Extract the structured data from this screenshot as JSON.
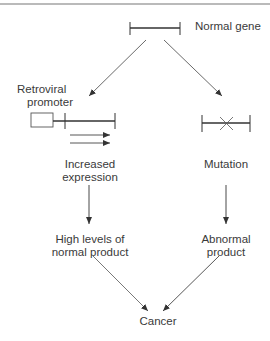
{
  "diagram": {
    "type": "flowchart",
    "nodes": {
      "normal_gene": {
        "label": "Normal gene"
      },
      "retroviral_promoter": {
        "line1": "Retroviral",
        "line2": "promoter"
      },
      "increased_expression": {
        "line1": "Increased",
        "line2": "expression"
      },
      "mutation": {
        "label": "Mutation"
      },
      "high_levels": {
        "line1": "High levels of",
        "line2": "normal product"
      },
      "abnormal_product": {
        "line1": "Abnormal",
        "line2": "product"
      },
      "cancer": {
        "label": "Cancer"
      }
    },
    "edges": [
      {
        "from": "normal_gene",
        "to": "retroviral_promoter"
      },
      {
        "from": "normal_gene",
        "to": "mutation"
      },
      {
        "from": "increased_expression",
        "to": "high_levels"
      },
      {
        "from": "mutation",
        "to": "abnormal_product"
      },
      {
        "from": "high_levels",
        "to": "cancer"
      },
      {
        "from": "abnormal_product",
        "to": "cancer"
      }
    ],
    "colors": {
      "line": "#333333",
      "text": "#3a3a3a"
    }
  }
}
